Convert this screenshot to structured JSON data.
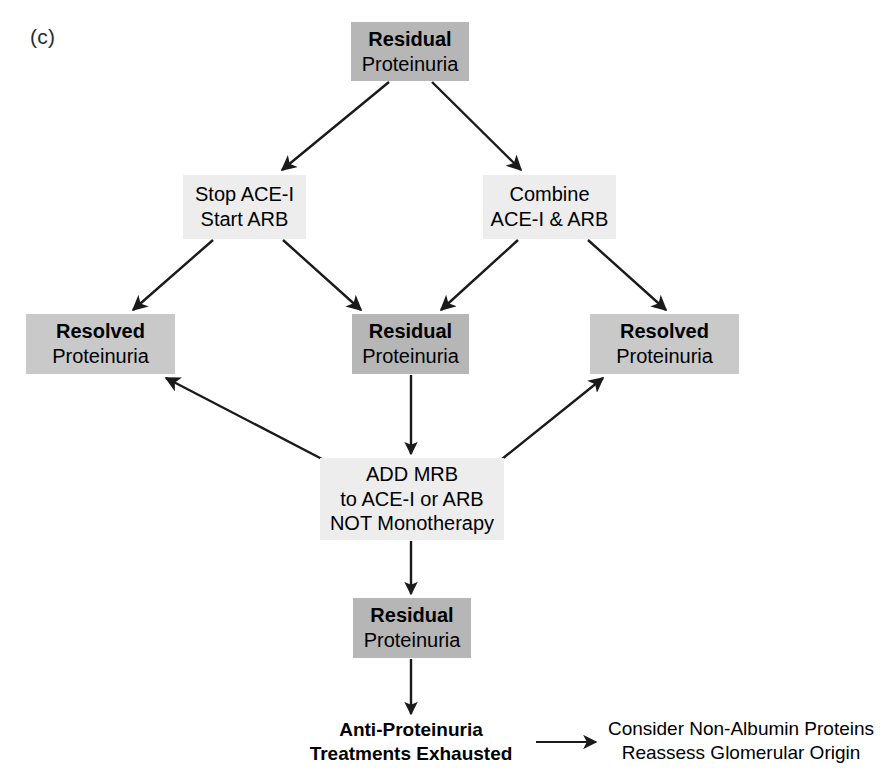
{
  "panel": {
    "label": "(c)"
  },
  "palette": {
    "residual_fill": "#b6b6b6",
    "treatment_fill": "#ededed",
    "resolved_fill": "#c9c9c9",
    "edge_color": "#1a1a1a",
    "text_color": "#000000",
    "background": "#ffffff"
  },
  "nodes": {
    "top_residual": {
      "line1": "Residual",
      "line2": "Proteinuria"
    },
    "stop_ace": {
      "line1": "Stop ACE-I",
      "line2": "Start ARB"
    },
    "combine_ace_arb": {
      "line1": "Combine",
      "line2": "ACE-I & ARB"
    },
    "resolved_left": {
      "line1": "Resolved",
      "line2": "Proteinuria"
    },
    "residual_middle": {
      "line1": "Residual",
      "line2": "Proteinuria"
    },
    "resolved_right": {
      "line1": "Resolved",
      "line2": "Proteinuria"
    },
    "add_mrb": {
      "line1": "ADD MRB",
      "line2": "to ACE-I or ARB",
      "line3": "NOT Monotherapy"
    },
    "residual_bottom": {
      "line1": "Residual",
      "line2": "Proteinuria"
    },
    "treatments_exhausted": {
      "line1": "Anti-Proteinuria",
      "line2": "Treatments Exhausted"
    },
    "consider_next": {
      "line1": "Consider Non-Albumin Proteins",
      "line2": "Reassess Glomerular Origin"
    }
  },
  "edges": [
    {
      "id": "top-to-stop",
      "from": "top_residual",
      "to": "stop_ace",
      "kind": "diagonal-down-left"
    },
    {
      "id": "top-to-combine",
      "from": "top_residual",
      "to": "combine_ace_arb",
      "kind": "diagonal-down-right"
    },
    {
      "id": "stop-to-resolvedl",
      "from": "stop_ace",
      "to": "resolved_left",
      "kind": "diagonal-down-left"
    },
    {
      "id": "stop-to-residualm",
      "from": "stop_ace",
      "to": "residual_middle",
      "kind": "diagonal-down-right"
    },
    {
      "id": "combine-to-residualm",
      "from": "combine_ace_arb",
      "to": "residual_middle",
      "kind": "diagonal-down-left"
    },
    {
      "id": "combine-to-resolvedr",
      "from": "combine_ace_arb",
      "to": "resolved_right",
      "kind": "diagonal-down-right"
    },
    {
      "id": "residualm-to-mrb",
      "from": "residual_middle",
      "to": "add_mrb",
      "kind": "vertical-down"
    },
    {
      "id": "mrb-to-resolvedl",
      "from": "add_mrb",
      "to": "resolved_left",
      "kind": "diagonal-up-left"
    },
    {
      "id": "mrb-to-resolvedr",
      "from": "add_mrb",
      "to": "resolved_right",
      "kind": "diagonal-up-right"
    },
    {
      "id": "mrb-to-residualb",
      "from": "add_mrb",
      "to": "residual_bottom",
      "kind": "vertical-down"
    },
    {
      "id": "residualb-to-exhausted",
      "from": "residual_bottom",
      "to": "treatments_exhausted",
      "kind": "vertical-down"
    },
    {
      "id": "exhausted-to-consider",
      "from": "treatments_exhausted",
      "to": "consider_next",
      "kind": "horizontal-right"
    }
  ]
}
